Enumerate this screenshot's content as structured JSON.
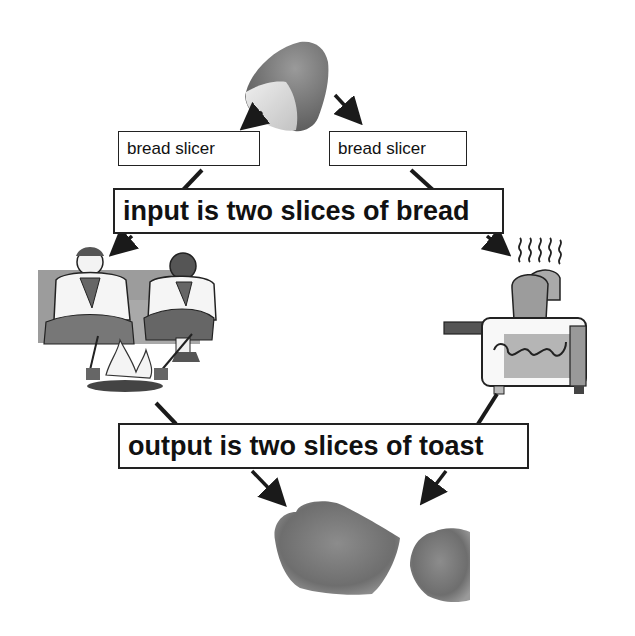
{
  "diagram": {
    "input_node": {
      "label": "bread loaf",
      "icon": "bread-loaf-icon"
    },
    "slicers": [
      {
        "label": "bread slicer"
      },
      {
        "label": "bread slicer"
      }
    ],
    "input_label": "input is two slices of bread",
    "processes": [
      {
        "label": "campfire toasting",
        "icon": "scouts-campfire-icon"
      },
      {
        "label": "toaster",
        "icon": "toaster-icon"
      }
    ],
    "output_label": "output is two slices of toast",
    "outputs": [
      {
        "label": "toast slice",
        "icon": "toast-slice-icon"
      },
      {
        "label": "toast slice",
        "icon": "toast-slice-icon"
      }
    ]
  },
  "colors": {
    "arrow": "#1a1a1a",
    "box_border": "#222222",
    "text": "#111111",
    "bread": "#c8c8c8",
    "toast": "#7a7a7a"
  }
}
